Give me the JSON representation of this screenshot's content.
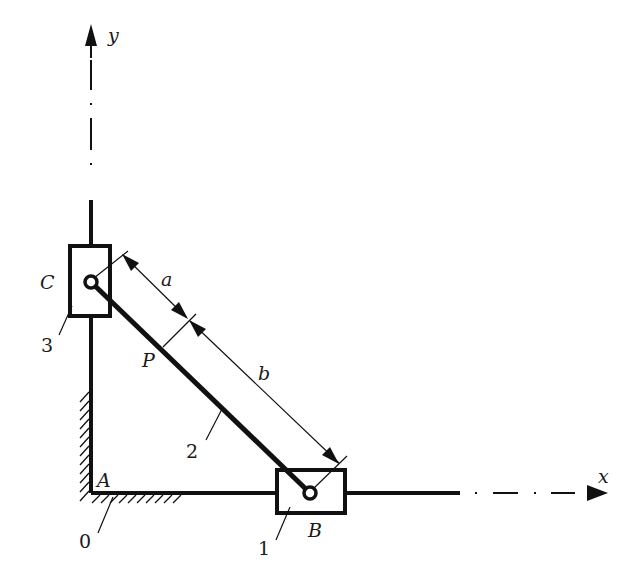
{
  "diagram": {
    "type": "mechanism-schematic",
    "axes": {
      "x_label": "x",
      "y_label": "y",
      "origin_label": "A"
    },
    "points": {
      "A": "A",
      "B": "B",
      "C": "C",
      "P": "P"
    },
    "dimensions": {
      "a": "a",
      "b": "b"
    },
    "part_numbers": {
      "ground": "0",
      "slider_B": "1",
      "link": "2",
      "slider_C": "3"
    },
    "colors": {
      "stroke": "#111111",
      "background": "#ffffff"
    }
  }
}
